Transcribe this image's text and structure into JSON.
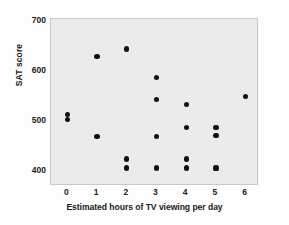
{
  "chart_data": {
    "type": "scatter",
    "title": "",
    "xlabel": "Estimated hours of TV viewing per day",
    "ylabel": "SAT score",
    "xlim": [
      -0.55,
      6.45
    ],
    "ylim": [
      370,
      705
    ],
    "xticks": [
      "0",
      "1",
      "2",
      "3",
      "4",
      "5",
      "6"
    ],
    "xtick_values": [
      0,
      1,
      2,
      3,
      4,
      5,
      6
    ],
    "yticks": [
      "700",
      "600",
      "500",
      "400"
    ],
    "ytick_values": [
      700,
      600,
      500,
      400
    ],
    "grid": false,
    "legend": null,
    "marker": "filled-circle",
    "marker_color": "#111111",
    "plot_background": "#ebebeb",
    "points": [
      {
        "x": 0,
        "y": 514
      },
      {
        "x": 0,
        "y": 504
      },
      {
        "x": 1,
        "y": 630
      },
      {
        "x": 1,
        "y": 469
      },
      {
        "x": 2,
        "y": 645
      },
      {
        "x": 2,
        "y": 424
      },
      {
        "x": 2,
        "y": 406
      },
      {
        "x": 3,
        "y": 588
      },
      {
        "x": 3,
        "y": 543
      },
      {
        "x": 3,
        "y": 470
      },
      {
        "x": 3,
        "y": 406
      },
      {
        "x": 4,
        "y": 534
      },
      {
        "x": 4,
        "y": 487
      },
      {
        "x": 4,
        "y": 424
      },
      {
        "x": 4,
        "y": 406
      },
      {
        "x": 5,
        "y": 487
      },
      {
        "x": 5,
        "y": 471
      },
      {
        "x": 5,
        "y": 406
      },
      {
        "x": 6,
        "y": 549
      }
    ]
  }
}
